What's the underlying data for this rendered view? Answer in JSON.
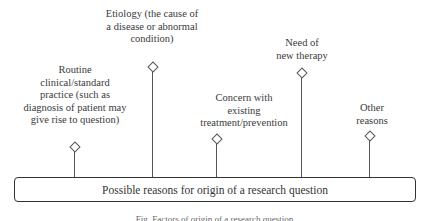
{
  "diagram": {
    "central_box": "Possible reasons for origin of a research question",
    "reasons": [
      {
        "id": "routine",
        "lines": [
          "Routine",
          "clinical/standard",
          "practice (such as",
          "diagnosis of patient may",
          "give rise to question)"
        ]
      },
      {
        "id": "etiology",
        "lines": [
          "Etiology (the cause of",
          "a disease or abnormal",
          "condition)"
        ]
      },
      {
        "id": "concern",
        "lines": [
          "Concern with",
          "existing",
          "treatment/prevention"
        ]
      },
      {
        "id": "therapy",
        "lines": [
          "Need of",
          "new therapy"
        ]
      },
      {
        "id": "other",
        "lines": [
          "Other",
          "reasons"
        ]
      }
    ],
    "caption": "Fig. Factors of origin of a research question"
  }
}
